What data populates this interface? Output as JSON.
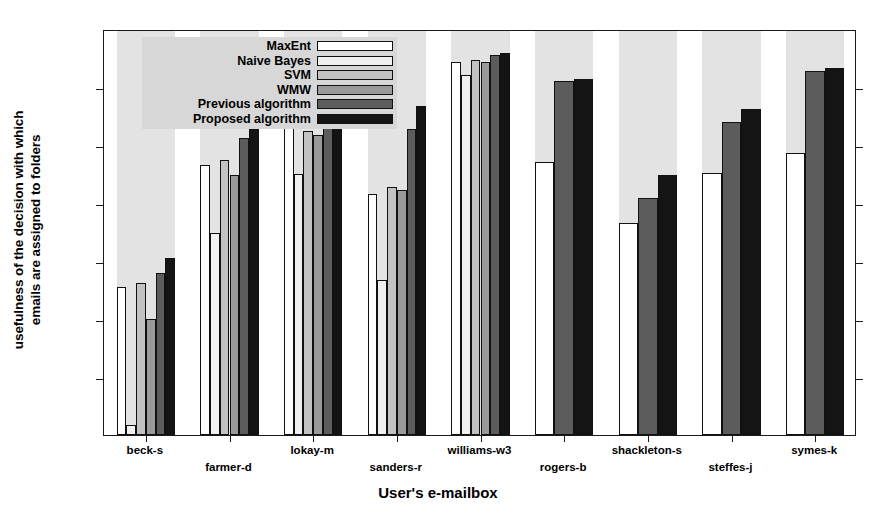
{
  "chart_data": {
    "type": "bar",
    "title": "",
    "xlabel": "User's e-mailbox",
    "ylabel_lines": [
      "usefulness of the decision with which",
      "emails are assigned to folders"
    ],
    "ylabel": "usefulness of the decision with which emails are assigned to folders",
    "ylim": [
      0.3,
      1
    ],
    "yticks": [
      0.3,
      0.4,
      0.5,
      0.6,
      0.7,
      0.8,
      0.9,
      1
    ],
    "ytick_labels": [
      "0.3",
      "0.4",
      "0.5",
      "0.6",
      "0.7",
      "0.8",
      "0.9",
      "1"
    ],
    "grid": false,
    "legend_position": "top-left-inside",
    "categories": [
      "beck-s",
      "farmer-d",
      "lokay-m",
      "sanders-r",
      "williams-w3",
      "rogers-b",
      "shackleton-s",
      "steffes-j",
      "symes-k"
    ],
    "series": [
      {
        "name": "MaxEnt",
        "color": "#ffffff",
        "values": [
          0.555,
          0.766,
          0.835,
          0.715,
          0.943,
          0.77,
          0.665,
          0.752,
          0.787
        ]
      },
      {
        "name": "Naive Bayes",
        "color": "#f0f0f0",
        "values": [
          0.318,
          0.648,
          0.75,
          0.567,
          0.92,
          null,
          null,
          null,
          null
        ]
      },
      {
        "name": "SVM",
        "color": "#c2c2c2",
        "values": [
          0.562,
          0.775,
          0.825,
          0.727,
          0.946,
          null,
          null,
          null,
          null
        ]
      },
      {
        "name": "WMW",
        "color": "#9a9a9a",
        "values": [
          0.5,
          0.748,
          0.818,
          0.722,
          0.943,
          null,
          null,
          null,
          null
        ]
      },
      {
        "name": "Previous algorithm",
        "color": "#5c5c5c",
        "values": [
          0.58,
          0.812,
          0.885,
          0.828,
          0.955,
          0.91,
          0.708,
          0.84,
          0.928
        ]
      },
      {
        "name": "Proposed algorithm",
        "color": "#141414",
        "values": [
          0.605,
          0.838,
          0.888,
          0.868,
          0.958,
          0.913,
          0.748,
          0.862,
          0.933
        ]
      }
    ]
  },
  "axes": {
    "band_color": "#e3e3e3",
    "frame_color": "#1a1a1a",
    "background": "#ffffff"
  }
}
